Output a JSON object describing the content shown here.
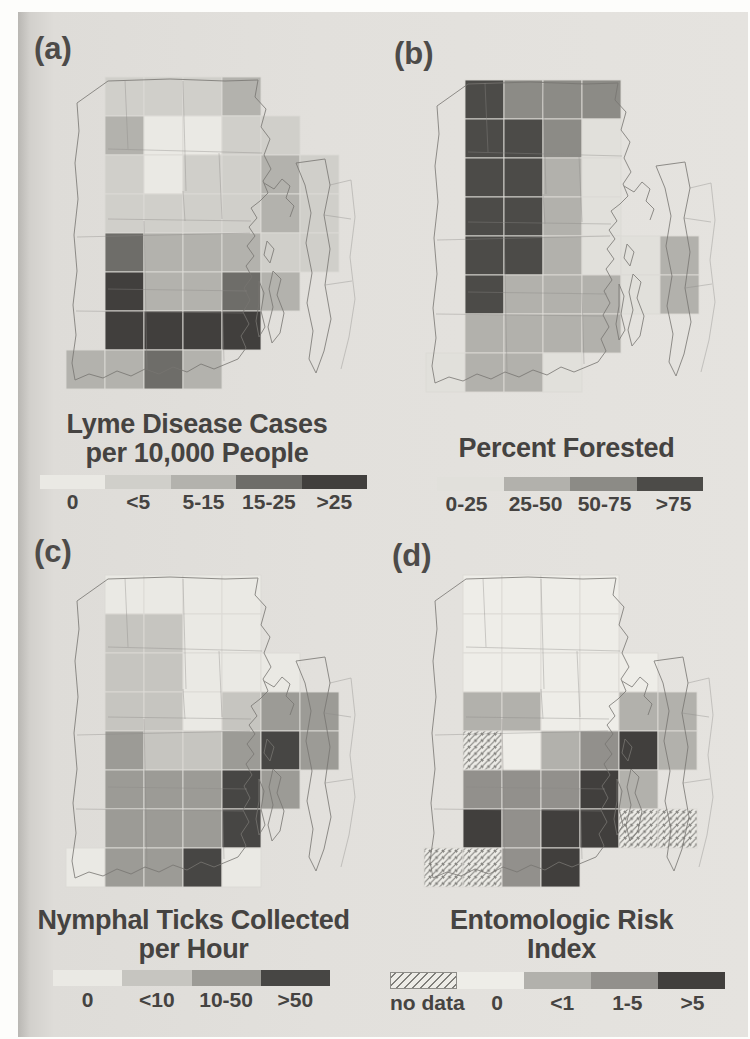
{
  "page": {
    "background_color": "#dedcd8",
    "margin_color": "#fdfdfb"
  },
  "panels": [
    {
      "id": "a",
      "label": "(a)",
      "title_lines": [
        "Lyme Disease Cases",
        "per 10,000 People"
      ],
      "legend": [
        {
          "label": "0",
          "color": "#eae9e4",
          "hatched": false
        },
        {
          "label": "<5",
          "color": "#d0cfca",
          "hatched": false
        },
        {
          "label": "5-15",
          "color": "#b3b2ad",
          "hatched": false
        },
        {
          "label": "15-25",
          "color": "#6e6d69",
          "hatched": false
        },
        {
          "label": ">25",
          "color": "#413f3d",
          "hatched": false
        }
      ],
      "cells": [
        [
          0,
          1,
          1
        ],
        [
          0,
          2,
          1
        ],
        [
          0,
          3,
          1
        ],
        [
          0,
          4,
          2
        ],
        [
          1,
          1,
          2
        ],
        [
          1,
          2,
          0
        ],
        [
          1,
          3,
          0
        ],
        [
          1,
          4,
          1
        ],
        [
          1,
          5,
          1
        ],
        [
          2,
          1,
          1
        ],
        [
          2,
          2,
          0
        ],
        [
          2,
          3,
          1
        ],
        [
          2,
          4,
          1
        ],
        [
          2,
          5,
          2
        ],
        [
          2,
          6,
          1
        ],
        [
          3,
          1,
          1
        ],
        [
          3,
          2,
          1
        ],
        [
          3,
          3,
          1
        ],
        [
          3,
          4,
          1
        ],
        [
          3,
          5,
          2
        ],
        [
          3,
          6,
          1
        ],
        [
          4,
          1,
          3
        ],
        [
          4,
          2,
          2
        ],
        [
          4,
          3,
          2
        ],
        [
          4,
          4,
          2
        ],
        [
          4,
          5,
          1
        ],
        [
          4,
          6,
          1
        ],
        [
          5,
          1,
          4
        ],
        [
          5,
          2,
          2
        ],
        [
          5,
          3,
          2
        ],
        [
          5,
          4,
          3
        ],
        [
          5,
          5,
          2
        ],
        [
          6,
          1,
          4
        ],
        [
          6,
          2,
          4
        ],
        [
          6,
          3,
          4
        ],
        [
          6,
          4,
          4
        ],
        [
          7,
          0,
          2
        ],
        [
          7,
          1,
          2
        ],
        [
          7,
          2,
          3
        ],
        [
          7,
          3,
          2
        ]
      ]
    },
    {
      "id": "b",
      "label": "(b)",
      "title_lines": [
        "Percent Forested"
      ],
      "legend": [
        {
          "label": "0-25",
          "color": "#e1e0db",
          "hatched": false
        },
        {
          "label": "25-50",
          "color": "#b2b1ac",
          "hatched": false
        },
        {
          "label": "50-75",
          "color": "#8c8b86",
          "hatched": false
        },
        {
          "label": ">75",
          "color": "#4c4b48",
          "hatched": false
        }
      ],
      "cells": [
        [
          0,
          1,
          3
        ],
        [
          0,
          2,
          2
        ],
        [
          0,
          3,
          2
        ],
        [
          0,
          4,
          2
        ],
        [
          1,
          1,
          3
        ],
        [
          1,
          2,
          3
        ],
        [
          1,
          3,
          2
        ],
        [
          1,
          4,
          0
        ],
        [
          2,
          1,
          3
        ],
        [
          2,
          2,
          3
        ],
        [
          2,
          3,
          1
        ],
        [
          2,
          4,
          0
        ],
        [
          3,
          1,
          3
        ],
        [
          3,
          2,
          3
        ],
        [
          3,
          3,
          1
        ],
        [
          3,
          4,
          0
        ],
        [
          4,
          1,
          3
        ],
        [
          4,
          2,
          3
        ],
        [
          4,
          3,
          1
        ],
        [
          4,
          4,
          0
        ],
        [
          4,
          5,
          0
        ],
        [
          4,
          6,
          1
        ],
        [
          5,
          1,
          3
        ],
        [
          5,
          2,
          1
        ],
        [
          5,
          3,
          1
        ],
        [
          5,
          4,
          1
        ],
        [
          5,
          5,
          0
        ],
        [
          5,
          6,
          1
        ],
        [
          6,
          1,
          1
        ],
        [
          6,
          2,
          1
        ],
        [
          6,
          3,
          1
        ],
        [
          6,
          4,
          1
        ],
        [
          7,
          0,
          0
        ],
        [
          7,
          1,
          1
        ],
        [
          7,
          2,
          1
        ],
        [
          7,
          3,
          0
        ]
      ]
    },
    {
      "id": "c",
      "label": "(c)",
      "title_lines": [
        "Nymphal Ticks Collected",
        "per Hour"
      ],
      "legend": [
        {
          "label": "0",
          "color": "#eae9e4",
          "hatched": false
        },
        {
          "label": "<10",
          "color": "#c6c5c0",
          "hatched": false
        },
        {
          "label": "10-50",
          "color": "#9c9b96",
          "hatched": false
        },
        {
          "label": ">50",
          "color": "#474644",
          "hatched": false
        }
      ],
      "cells": [
        [
          0,
          1,
          0
        ],
        [
          0,
          2,
          0
        ],
        [
          0,
          3,
          0
        ],
        [
          0,
          4,
          0
        ],
        [
          1,
          1,
          1
        ],
        [
          1,
          2,
          1
        ],
        [
          1,
          3,
          0
        ],
        [
          1,
          4,
          0
        ],
        [
          2,
          1,
          1
        ],
        [
          2,
          2,
          1
        ],
        [
          2,
          3,
          0
        ],
        [
          2,
          4,
          0
        ],
        [
          2,
          5,
          0
        ],
        [
          3,
          1,
          1
        ],
        [
          3,
          2,
          1
        ],
        [
          3,
          3,
          0
        ],
        [
          3,
          4,
          1
        ],
        [
          3,
          5,
          2
        ],
        [
          3,
          6,
          2
        ],
        [
          4,
          1,
          2
        ],
        [
          4,
          2,
          1
        ],
        [
          4,
          3,
          1
        ],
        [
          4,
          4,
          2
        ],
        [
          4,
          5,
          3
        ],
        [
          4,
          6,
          2
        ],
        [
          5,
          1,
          2
        ],
        [
          5,
          2,
          2
        ],
        [
          5,
          3,
          2
        ],
        [
          5,
          4,
          3
        ],
        [
          5,
          5,
          2
        ],
        [
          6,
          1,
          2
        ],
        [
          6,
          2,
          2
        ],
        [
          6,
          3,
          2
        ],
        [
          6,
          4,
          3
        ],
        [
          7,
          0,
          0
        ],
        [
          7,
          1,
          2
        ],
        [
          7,
          2,
          2
        ],
        [
          7,
          3,
          3
        ],
        [
          7,
          4,
          0
        ]
      ]
    },
    {
      "id": "d",
      "label": "(d)",
      "title_lines": [
        "Entomologic Risk",
        "Index"
      ],
      "legend": [
        {
          "label": "no data",
          "color": "#edece7",
          "hatched": true
        },
        {
          "label": "0",
          "color": "#eeede8",
          "hatched": false
        },
        {
          "label": "<1",
          "color": "#b2b1ac",
          "hatched": false
        },
        {
          "label": "1-5",
          "color": "#92908c",
          "hatched": false
        },
        {
          "label": ">5",
          "color": "#413f3d",
          "hatched": false
        }
      ],
      "cells": [
        [
          0,
          1,
          1
        ],
        [
          0,
          2,
          1
        ],
        [
          0,
          3,
          1
        ],
        [
          0,
          4,
          1
        ],
        [
          1,
          1,
          1
        ],
        [
          1,
          2,
          1
        ],
        [
          1,
          3,
          1
        ],
        [
          1,
          4,
          1
        ],
        [
          2,
          1,
          1
        ],
        [
          2,
          2,
          1
        ],
        [
          2,
          3,
          1
        ],
        [
          2,
          4,
          1
        ],
        [
          2,
          5,
          1
        ],
        [
          3,
          1,
          2
        ],
        [
          3,
          2,
          2
        ],
        [
          3,
          3,
          1
        ],
        [
          3,
          4,
          1
        ],
        [
          3,
          5,
          2
        ],
        [
          3,
          6,
          2
        ],
        [
          4,
          1,
          0
        ],
        [
          4,
          2,
          1
        ],
        [
          4,
          3,
          2
        ],
        [
          4,
          4,
          3
        ],
        [
          4,
          5,
          4
        ],
        [
          4,
          6,
          2
        ],
        [
          5,
          1,
          3
        ],
        [
          5,
          2,
          3
        ],
        [
          5,
          3,
          3
        ],
        [
          5,
          4,
          4
        ],
        [
          5,
          5,
          2
        ],
        [
          6,
          1,
          4
        ],
        [
          6,
          2,
          3
        ],
        [
          6,
          3,
          4
        ],
        [
          6,
          4,
          4
        ],
        [
          6,
          5,
          0
        ],
        [
          6,
          6,
          0
        ],
        [
          7,
          0,
          0
        ],
        [
          7,
          1,
          0
        ],
        [
          7,
          2,
          3
        ],
        [
          7,
          3,
          4
        ]
      ]
    }
  ]
}
